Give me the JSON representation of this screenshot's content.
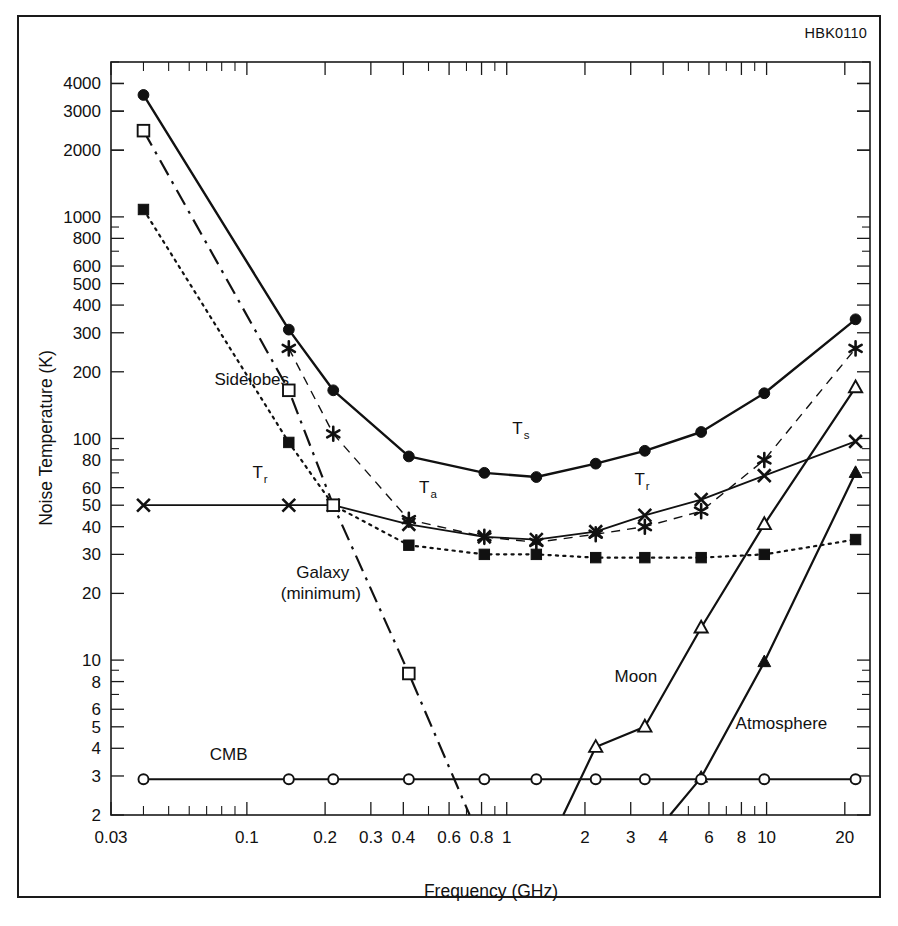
{
  "figure": {
    "code": "HBK0110"
  },
  "chart_data": {
    "type": "line",
    "title": "",
    "xlabel": "Frequency (GHz)",
    "ylabel": "Noise Temperature (K)",
    "xscale": "log",
    "yscale": "log",
    "xlim": [
      0.03,
      25
    ],
    "ylim": [
      2,
      5000
    ],
    "grid": false,
    "legend_position": "inline-annotations",
    "xticks": [
      "0.03",
      "0.1",
      "0.2",
      "0.3",
      "0.4",
      "0.6",
      "0.8",
      "1",
      "2",
      "3",
      "4",
      "6",
      "8",
      "10",
      "20"
    ],
    "xtick_values": [
      0.03,
      0.1,
      0.2,
      0.3,
      0.4,
      0.6,
      0.8,
      1,
      2,
      3,
      4,
      6,
      8,
      10,
      20
    ],
    "yticks": [
      "4000",
      "3000",
      "2000",
      "1000",
      "800",
      "600",
      "500",
      "400",
      "300",
      "200",
      "100",
      "80",
      "60",
      "50",
      "40",
      "30",
      "20",
      "10",
      "8",
      "6",
      "5",
      "4",
      "3",
      "2"
    ],
    "ytick_values": [
      4000,
      3000,
      2000,
      1000,
      800,
      600,
      500,
      400,
      300,
      200,
      100,
      80,
      60,
      50,
      40,
      30,
      20,
      10,
      8,
      6,
      5,
      4,
      3,
      2
    ],
    "annotations": [
      {
        "text": "Sidelobes",
        "x": 0.075,
        "y": 175
      },
      {
        "text": "T",
        "sub": "r",
        "x": 0.105,
        "y": 66
      },
      {
        "text": "T",
        "sub": "a",
        "x": 0.46,
        "y": 57
      },
      {
        "text": "T",
        "sub": "s",
        "x": 1.05,
        "y": 105
      },
      {
        "text": "T",
        "sub": "r",
        "x": 3.1,
        "y": 62
      },
      {
        "text": "Galaxy",
        "x": 0.155,
        "y": 23.5
      },
      {
        "text": "(minimum)",
        "x": 0.135,
        "y": 18.8
      },
      {
        "text": "CMB",
        "x": 0.072,
        "y": 3.55
      },
      {
        "text": "Moon",
        "x": 2.6,
        "y": 8.0
      },
      {
        "text": "Atmosphere",
        "x": 7.6,
        "y": 4.9
      }
    ],
    "series": [
      {
        "name": "Ts",
        "label": "T_s system noise temperature",
        "style": "solid",
        "marker": "filled-circle",
        "linewidth": 2.4,
        "points": [
          [
            0.04,
            3550
          ],
          [
            0.145,
            310
          ],
          [
            0.215,
            165
          ],
          [
            0.42,
            83
          ],
          [
            0.82,
            70
          ],
          [
            1.3,
            67
          ],
          [
            2.2,
            77
          ],
          [
            3.4,
            88
          ],
          [
            5.6,
            107
          ],
          [
            9.8,
            160
          ],
          [
            22.0,
            345
          ]
        ]
      },
      {
        "name": "Sidelobes",
        "label": "Sidelobe contribution",
        "style": "dashed",
        "marker": "asterisk",
        "linewidth": 1.4,
        "points": [
          [
            0.145,
            255
          ],
          [
            0.215,
            105
          ],
          [
            0.42,
            43
          ],
          [
            0.82,
            36
          ],
          [
            1.3,
            34
          ],
          [
            2.2,
            37
          ],
          [
            3.4,
            40
          ],
          [
            5.6,
            47
          ],
          [
            9.8,
            80
          ],
          [
            22.0,
            255
          ]
        ]
      },
      {
        "name": "Tr",
        "label": "T_r receiver noise temperature",
        "style": "solid",
        "marker": "x-cross",
        "linewidth": 1.8,
        "points": [
          [
            0.04,
            50
          ],
          [
            0.145,
            50
          ],
          [
            0.215,
            50
          ],
          [
            0.42,
            41
          ],
          [
            0.82,
            36
          ],
          [
            1.3,
            35
          ],
          [
            2.2,
            38
          ],
          [
            3.4,
            45
          ],
          [
            5.6,
            53
          ],
          [
            9.8,
            68
          ],
          [
            22.0,
            97
          ]
        ]
      },
      {
        "name": "Ta",
        "label": "T_a antenna noise temperature",
        "style": "dotted",
        "marker": "filled-square",
        "linewidth": 2.2,
        "points": [
          [
            0.04,
            1080
          ],
          [
            0.145,
            96
          ],
          [
            0.215,
            50
          ],
          [
            0.42,
            33
          ],
          [
            0.82,
            30
          ],
          [
            1.3,
            30
          ],
          [
            2.2,
            29
          ],
          [
            3.4,
            29
          ],
          [
            5.6,
            29
          ],
          [
            9.8,
            30
          ],
          [
            22.0,
            35
          ]
        ]
      },
      {
        "name": "Galaxy (minimum)",
        "label": "Galactic background, minimum",
        "style": "dashdot",
        "marker": "open-square",
        "linewidth": 2.2,
        "points": [
          [
            0.04,
            2450
          ],
          [
            0.145,
            165
          ],
          [
            0.215,
            50
          ],
          [
            0.42,
            8.7
          ],
          [
            0.72,
            2.0
          ]
        ]
      },
      {
        "name": "Moon",
        "label": "Moon contribution",
        "style": "solid",
        "marker": "open-triangle",
        "linewidth": 2.2,
        "points": [
          [
            1.65,
            2.0
          ],
          [
            2.2,
            4.05
          ],
          [
            3.4,
            5.0
          ],
          [
            5.6,
            14.0
          ],
          [
            9.8,
            41.0
          ],
          [
            22.0,
            170.0
          ]
        ]
      },
      {
        "name": "Atmosphere",
        "label": "Atmospheric contribution",
        "style": "solid",
        "marker": "filled-triangle",
        "linewidth": 2.2,
        "points": [
          [
            4.25,
            2.0
          ],
          [
            5.6,
            2.95
          ],
          [
            9.8,
            9.8
          ],
          [
            22.0,
            70.0
          ]
        ]
      },
      {
        "name": "CMB",
        "label": "Cosmic microwave background",
        "style": "solid",
        "marker": "open-circle",
        "linewidth": 1.8,
        "points": [
          [
            0.04,
            2.9
          ],
          [
            0.145,
            2.9
          ],
          [
            0.215,
            2.9
          ],
          [
            0.42,
            2.9
          ],
          [
            0.82,
            2.9
          ],
          [
            1.3,
            2.9
          ],
          [
            2.2,
            2.9
          ],
          [
            3.4,
            2.9
          ],
          [
            5.6,
            2.9
          ],
          [
            9.8,
            2.9
          ],
          [
            22.0,
            2.9
          ]
        ]
      }
    ]
  }
}
